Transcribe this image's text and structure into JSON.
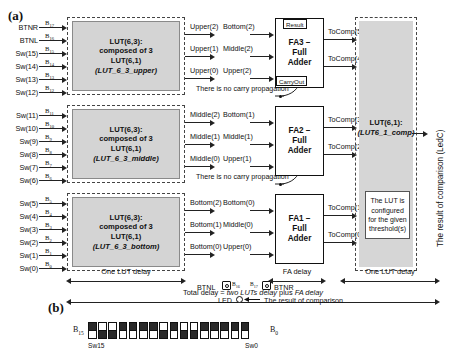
{
  "panels": {
    "a_label": "(a)",
    "b_label": "(b)"
  },
  "lut_blocks": [
    {
      "id": "upper",
      "title_line1": "LUT(6,3):",
      "title_line2": "composed of 3",
      "title_line3": "LUT(6,1)",
      "title_line4": "(LUT_6_3_upper)",
      "inputs": [
        {
          "name": "BTNR",
          "bit": "B",
          "index": "17"
        },
        {
          "name": "BTNL",
          "bit": "B",
          "index": "16"
        },
        {
          "name": "Sw(15)",
          "bit": "B",
          "index": "15"
        },
        {
          "name": "Sw(14)",
          "bit": "B",
          "index": "14"
        },
        {
          "name": "Sw(13)",
          "bit": "B",
          "index": "13"
        },
        {
          "name": "Sw(12)",
          "bit": "B",
          "index": "12"
        }
      ],
      "outputs": [
        "Upper(2)",
        "Upper(1)",
        "Upper(0)"
      ]
    },
    {
      "id": "middle",
      "title_line1": "LUT(6,3):",
      "title_line2": "composed of 3",
      "title_line3": "LUT(6,1)",
      "title_line4": "(LUT_6_3_middle)",
      "inputs": [
        {
          "name": "Sw(11)",
          "bit": "B",
          "index": "11"
        },
        {
          "name": "Sw(10)",
          "bit": "B",
          "index": "10"
        },
        {
          "name": "Sw(9)",
          "bit": "B",
          "index": "9"
        },
        {
          "name": "Sw(8)",
          "bit": "B",
          "index": "8"
        },
        {
          "name": "Sw(7)",
          "bit": "B",
          "index": "7"
        },
        {
          "name": "Sw(6)",
          "bit": "B",
          "index": "6"
        }
      ],
      "outputs": [
        "Middle(2)",
        "Middle(1)",
        "Middle(0)"
      ]
    },
    {
      "id": "bottom",
      "title_line1": "LUT(6,3):",
      "title_line2": "composed of 3",
      "title_line3": "LUT(6,1)",
      "title_line4": "(LUT_6_3_bottom)",
      "inputs": [
        {
          "name": "Sw(5)",
          "bit": "B",
          "index": "5"
        },
        {
          "name": "Sw(4)",
          "bit": "B",
          "index": "4"
        },
        {
          "name": "Sw(3)",
          "bit": "B",
          "index": "3"
        },
        {
          "name": "Sw(2)",
          "bit": "B",
          "index": "2"
        },
        {
          "name": "Sw(1)",
          "bit": "B",
          "index": "1"
        },
        {
          "name": "Sw(0)",
          "bit": "B",
          "index": "0"
        }
      ],
      "outputs": [
        "Bottom(2)",
        "Bottom(1)",
        "Bottom(0)"
      ]
    }
  ],
  "adders": [
    {
      "id": "fa3",
      "name_line1": "FA3 –",
      "name_line2": "Full",
      "name_line3": "Adder",
      "inputs": [
        "Bottom(2)",
        "Middle(2)",
        "Upper(2)"
      ],
      "tag_result": "Result",
      "tag_carry": "CarryOut",
      "outputs": [
        "ToComp(5)",
        "ToComp(4)"
      ]
    },
    {
      "id": "fa2",
      "name_line1": "FA2 –",
      "name_line2": "Full",
      "name_line3": "Adder",
      "inputs": [
        "Bottom(1)",
        "Middle(1)",
        "Upper(1)"
      ],
      "tag_result": "",
      "tag_carry": "",
      "outputs": [
        "ToComp(3)",
        "ToComp(2)"
      ]
    },
    {
      "id": "fa1",
      "name_line1": "FA1 –",
      "name_line2": "Full",
      "name_line3": "Adder",
      "inputs": [
        "Bottom(0)",
        "Middle(0)",
        "Upper(0)"
      ],
      "tag_result": "",
      "tag_carry": "",
      "outputs": [
        "ToComp(1)",
        "ToComp(0)"
      ]
    }
  ],
  "notes": {
    "no_carry_1": "There is no carry propagation",
    "no_carry_2": "There is no carry propagation"
  },
  "comparator": {
    "title_line1": "LUT(6,1):",
    "title_line2": "(LUT6_1_comp)",
    "note": "The LUT is configured for the given threshold(s)",
    "result_label": "The result of comparison (LedC)"
  },
  "delays": {
    "one_lut_delay_left": "One LUT delay",
    "fa_delay": "FA delay",
    "one_lut_delay_right": "One LUT delay",
    "total_prefix": "Total delay = ",
    "total_em1": "two LUTs delay",
    "total_mid": " plus ",
    "total_em2": "FA delay"
  },
  "legend": {
    "btnl_label": "BTNL",
    "btnr_label": "BTNR",
    "btnl_bit": "B",
    "btnl_index": "16",
    "btnr_bit": "B",
    "btnr_index": "17",
    "led_label": "LED",
    "led_desc": "The result of comparison"
  },
  "switch_bank": {
    "left_bit": "B",
    "left_index": "15",
    "right_bit": "B",
    "right_index": "0",
    "left_name": "Sw15",
    "right_name": "Sw0",
    "states": [
      "up",
      "down",
      "down",
      "up",
      "up",
      "up",
      "up",
      "down",
      "up",
      "down",
      "down",
      "up",
      "up",
      "up",
      "up",
      "up"
    ]
  }
}
